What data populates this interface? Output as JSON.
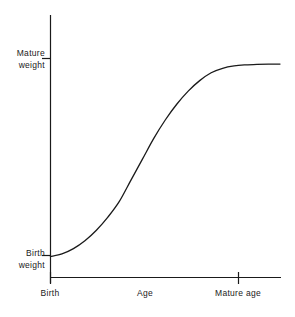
{
  "figure": {
    "background_color": "#ffffff",
    "line_color": "#1a1a1a",
    "axis_color": "#1a1a1a"
  },
  "chart_data": {
    "type": "line",
    "title": "",
    "subtitle": "",
    "xlabel": "Age",
    "ylabel": "",
    "grid": false,
    "legend": null,
    "xlim": [
      0,
      100
    ],
    "ylim": [
      0,
      100
    ],
    "x_tick_labels": [
      "Birth",
      "Mature age"
    ],
    "x_tick_values": [
      0,
      82
    ],
    "y_tick_labels": [
      "Birth weight",
      "Mature weight"
    ],
    "y_tick_values": [
      8,
      81
    ],
    "series": [
      {
        "name": "Growth curve",
        "description": "sigmoid growth curve from birth weight to mature weight",
        "x": [
          0,
          5,
          10,
          15,
          20,
          25,
          30,
          35,
          40,
          45,
          50,
          55,
          60,
          65,
          70,
          75,
          80,
          85,
          90,
          95,
          100
        ],
        "y": [
          8,
          9,
          11,
          14,
          18,
          23,
          29,
          37,
          45,
          53,
          60,
          66,
          71,
          75,
          78,
          79.7,
          80.6,
          81,
          81.2,
          81.3,
          81.3
        ]
      }
    ]
  },
  "labels": {
    "y_mature_line1": "Mature",
    "y_mature_line2": "weight",
    "y_birth_line1": "Birth",
    "y_birth_line2": "weight",
    "x_birth": "Birth",
    "x_age": "Age",
    "x_mature_age": "Mature age"
  }
}
